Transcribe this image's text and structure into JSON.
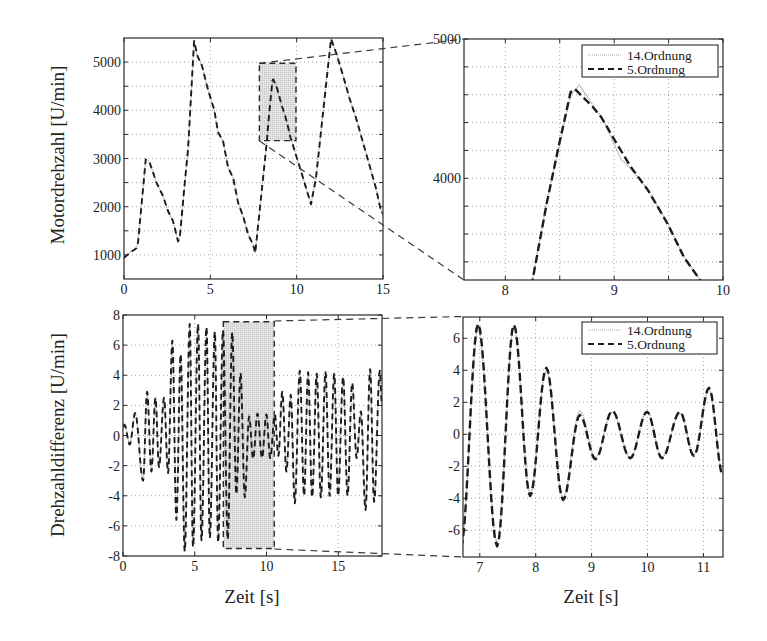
{
  "colors": {
    "series_14_ordnung": "#a6a6a6",
    "series_5_ordnung": "#1c1c1c",
    "zoom_fill": "#dadada",
    "grid": "#8c8c8c",
    "frame": "#2a2a2a"
  },
  "chart_data": [
    {
      "id": "motordrehzahl",
      "type": "line",
      "title": "",
      "xlabel": "",
      "ylabel": "Motordrehzahl [U/min]",
      "xlim": [
        0,
        15
      ],
      "ylim": [
        500,
        5500
      ],
      "xticks": [
        0,
        5,
        10,
        15
      ],
      "yticks": [
        1000,
        2000,
        3000,
        4000,
        5000
      ],
      "xgrid": [
        5,
        10
      ],
      "ygrid": [
        1000,
        1500,
        2000,
        2500,
        3000,
        3500,
        4000,
        4500,
        5000
      ],
      "grid": true,
      "legend": null,
      "interpolation": "linear",
      "zoom_region": {
        "x": [
          7.84,
          9.96
        ],
        "y": [
          3370,
          4975
        ]
      },
      "series": [
        {
          "name": "14.Ordnung",
          "style": "dotted",
          "color_key": "series_14_ordnung",
          "x": [
            0,
            0.33,
            0.72,
            0.81,
            1.26,
            1.49,
            1.88,
            2.26,
            2.55,
            2.84,
            3.13,
            3.23,
            3.52,
            3.71,
            4.06,
            4.25,
            4.52,
            4.78,
            5.03,
            5.22,
            5.45,
            5.74,
            6.03,
            6.32,
            6.61,
            6.9,
            7.19,
            7.48,
            7.6,
            8.25,
            8.38,
            8.49,
            8.6,
            8.64,
            8.8,
            8.88,
            9.0,
            9.15,
            9.31,
            9.49,
            9.64,
            9.78,
            10.25,
            10.83,
            11.12,
            11.6,
            11.99,
            12.28,
            12.66,
            13.05,
            13.43,
            13.82,
            14.2,
            14.59,
            14.88,
            15
          ],
          "y": [
            950,
            1050,
            1150,
            1260,
            2990,
            2920,
            2490,
            2230,
            1900,
            1710,
            1270,
            1360,
            2480,
            3200,
            5420,
            5140,
            4930,
            4530,
            4240,
            4010,
            3550,
            3350,
            2820,
            2590,
            2090,
            1790,
            1430,
            1200,
            1050,
            3275,
            3830,
            4250,
            4600,
            4670,
            4530,
            4420,
            4250,
            4060,
            3920,
            3680,
            3440,
            3280,
            2730,
            2060,
            2590,
            4200,
            5500,
            5190,
            4760,
            4250,
            3860,
            3350,
            2890,
            2380,
            1920,
            1840
          ]
        },
        {
          "name": "5.Ordnung",
          "style": "dashed",
          "color_key": "series_5_ordnung",
          "x": [
            0,
            0.33,
            0.72,
            0.81,
            1.26,
            1.49,
            1.88,
            2.26,
            2.55,
            2.84,
            3.13,
            3.23,
            3.52,
            3.71,
            4.06,
            4.25,
            4.52,
            4.78,
            5.03,
            5.22,
            5.45,
            5.74,
            6.03,
            6.32,
            6.61,
            6.9,
            7.19,
            7.48,
            7.6,
            8.25,
            8.38,
            8.49,
            8.6,
            8.64,
            8.8,
            8.88,
            9.0,
            9.15,
            9.31,
            9.49,
            9.64,
            9.78,
            10.25,
            10.83,
            11.12,
            11.6,
            11.99,
            12.28,
            12.66,
            13.05,
            13.43,
            13.82,
            14.2,
            14.59,
            14.88,
            15
          ],
          "y": [
            940,
            1040,
            1140,
            1250,
            2980,
            2910,
            2500,
            2220,
            1910,
            1700,
            1280,
            1350,
            2500,
            3190,
            5440,
            5130,
            4920,
            4540,
            4230,
            4020,
            3540,
            3360,
            2810,
            2600,
            2080,
            1800,
            1420,
            1210,
            1040,
            3270,
            3820,
            4230,
            4620,
            4640,
            4515,
            4440,
            4280,
            4085,
            3915,
            3675,
            3435,
            3280,
            2740,
            2050,
            2600,
            4190,
            5480,
            5200,
            4750,
            4260,
            3850,
            3360,
            2880,
            2390,
            1910,
            1850
          ]
        }
      ]
    },
    {
      "id": "motordrehzahl-zoom",
      "type": "line",
      "title": "",
      "xlabel": "",
      "ylabel": "",
      "xlim": [
        7.62,
        10
      ],
      "ylim": [
        3270,
        5000
      ],
      "xticks": [
        8,
        9,
        10
      ],
      "yticks": [
        4000,
        5000
      ],
      "xgrid": [
        8,
        8.5,
        9,
        9.5
      ],
      "ygrid": [
        3400,
        3600,
        3800,
        4000,
        4200,
        4400,
        4600,
        4800
      ],
      "grid": true,
      "legend": {
        "position": "upper right",
        "entries": [
          "14.Ordnung",
          "5.Ordnung"
        ]
      },
      "interpolation": "linear",
      "zoom_region": null,
      "series": [
        {
          "name": "14.Ordnung",
          "style": "dotted",
          "color_key": "series_14_ordnung",
          "x": [
            7.6,
            8.25,
            8.38,
            8.5,
            8.6,
            8.68,
            8.8,
            8.9,
            9.06,
            9.15,
            9.31,
            9.49,
            9.64,
            9.78,
            10.25
          ],
          "y": [
            1040,
            3275,
            3830,
            4250,
            4600,
            4670,
            4530,
            4420,
            4140,
            4070,
            3920,
            3680,
            3440,
            3280,
            2740
          ]
        },
        {
          "name": "5.Ordnung",
          "style": "dashed",
          "color_key": "series_5_ordnung",
          "x": [
            7.6,
            8.25,
            8.38,
            8.49,
            8.6,
            8.64,
            8.8,
            8.88,
            9.0,
            9.15,
            9.31,
            9.49,
            9.64,
            9.78,
            10.25
          ],
          "y": [
            1040,
            3270,
            3820,
            4230,
            4620,
            4640,
            4515,
            4440,
            4280,
            4085,
            3915,
            3675,
            3435,
            3280,
            2740
          ]
        }
      ]
    },
    {
      "id": "drehzahldifferenz",
      "type": "line",
      "title": "",
      "xlabel": "Zeit [s]",
      "ylabel": "Drehzahldifferenz [U/min]",
      "xlim": [
        0,
        18.05
      ],
      "ylim": [
        -8,
        8
      ],
      "xticks": [
        0,
        5,
        10,
        15
      ],
      "yticks": [
        -8,
        -6,
        -4,
        -2,
        0,
        2,
        4,
        6,
        8
      ],
      "xgrid": [
        5,
        10,
        15
      ],
      "ygrid": [
        -6,
        -4,
        -2,
        0,
        2,
        4,
        6
      ],
      "grid": true,
      "legend": null,
      "interpolation": "sinusoidal",
      "zoom_region": {
        "x": [
          6.99,
          10.54
        ],
        "y": [
          -7.5,
          7.55
        ]
      },
      "series": [
        {
          "name": "14.Ordnung",
          "style": "dotted",
          "color_key": "series_14_ordnung",
          "x": [
            0,
            0.1,
            0.47,
            0.85,
            1.4,
            1.68,
            1.98,
            2.26,
            2.51,
            2.86,
            3.14,
            3.44,
            3.72,
            4.02,
            4.3,
            4.65,
            4.88,
            5.23,
            5.47,
            5.82,
            6.05,
            6.4,
            6.63,
            6.97,
            7.3,
            7.61,
            7.9,
            8.19,
            8.49,
            8.79,
            9.07,
            9.37,
            9.69,
            9.99,
            10.26,
            10.58,
            10.83,
            11.1,
            11.39,
            11.69,
            11.97,
            12.32,
            12.62,
            12.9,
            13.18,
            13.5,
            13.79,
            14.11,
            14.4,
            14.72,
            14.99,
            15.34,
            15.65,
            15.97,
            16.28,
            16.58,
            16.9,
            17.22,
            17.5,
            17.9,
            18.05
          ],
          "y": [
            0.5,
            0.8,
            -0.5,
            1.4,
            -2.9,
            2.8,
            -2.3,
            2.6,
            -2.0,
            2.4,
            -2.4,
            6.1,
            -5.4,
            5.3,
            -7.5,
            7.2,
            -7.2,
            7.3,
            -6.8,
            7.0,
            -6.6,
            6.8,
            -6.9,
            6.8,
            -6.8,
            6.7,
            -3.7,
            4.0,
            -4.0,
            1.45,
            -1.45,
            1.4,
            -1.45,
            1.45,
            -1.45,
            1.35,
            -1.3,
            2.8,
            -2.3,
            2.6,
            -4.3,
            4.2,
            -3.9,
            4.1,
            -4.0,
            4.0,
            -4.0,
            4.1,
            -3.9,
            4.0,
            -3.9,
            3.8,
            -3.9,
            3.4,
            -1.4,
            1.5,
            -4.8,
            4.3,
            -4.3,
            4.2,
            1.9
          ]
        },
        {
          "name": "5.Ordnung",
          "style": "dashed",
          "color_key": "series_5_ordnung",
          "x": [
            0,
            0.1,
            0.47,
            0.85,
            1.4,
            1.68,
            1.98,
            2.26,
            2.51,
            2.86,
            3.14,
            3.44,
            3.72,
            4.02,
            4.3,
            4.65,
            4.88,
            5.23,
            5.47,
            5.82,
            6.05,
            6.4,
            6.63,
            6.97,
            7.3,
            7.61,
            7.9,
            8.19,
            8.49,
            8.79,
            9.07,
            9.37,
            9.69,
            9.99,
            10.26,
            10.58,
            10.83,
            11.1,
            11.39,
            11.69,
            11.97,
            12.32,
            12.62,
            12.9,
            13.18,
            13.5,
            13.79,
            14.11,
            14.4,
            14.72,
            14.99,
            15.34,
            15.65,
            15.97,
            16.28,
            16.58,
            16.9,
            17.22,
            17.5,
            17.9,
            18.05
          ],
          "y": [
            0.6,
            0.7,
            -0.6,
            1.5,
            -3.0,
            2.9,
            -2.4,
            2.5,
            -2.1,
            2.5,
            -2.5,
            6.3,
            -5.6,
            5.4,
            -7.7,
            7.4,
            -7.4,
            7.4,
            -6.95,
            7.2,
            -6.8,
            6.9,
            -7.1,
            7.0,
            -6.9,
            6.85,
            -3.9,
            4.15,
            -4.1,
            1.25,
            -1.55,
            1.45,
            -1.5,
            1.4,
            -1.5,
            1.4,
            -1.35,
            2.9,
            -2.4,
            2.7,
            -4.5,
            4.3,
            -4.0,
            4.2,
            -4.1,
            4.1,
            -4.1,
            4.2,
            -4.0,
            4.1,
            -4.0,
            3.9,
            -4.0,
            3.5,
            -1.5,
            1.6,
            -4.95,
            4.4,
            -4.4,
            4.3,
            2.0
          ]
        }
      ]
    },
    {
      "id": "drehzahldifferenz-zoom",
      "type": "line",
      "title": "",
      "xlabel": "Zeit [s]",
      "ylabel": "",
      "xlim": [
        6.7,
        11.35
      ],
      "ylim": [
        -7.67,
        7.33
      ],
      "xticks": [
        7,
        8,
        9,
        10,
        11
      ],
      "yticks": [
        -6,
        -4,
        -2,
        0,
        2,
        4,
        6
      ],
      "xgrid": [
        7,
        8,
        9,
        10,
        11
      ],
      "ygrid": [
        -6,
        -4,
        -2,
        0,
        2,
        4,
        6
      ],
      "grid": true,
      "legend": {
        "position": "upper right",
        "entries": [
          "14.Ordnung",
          "5.Ordnung"
        ]
      },
      "interpolation": "sinusoidal",
      "zoom_region": null,
      "series": [
        {
          "name": "14.Ordnung",
          "style": "dotted",
          "color_key": "series_14_ordnung",
          "x": [
            6.66,
            6.97,
            7.31,
            7.61,
            7.9,
            8.19,
            8.49,
            8.79,
            9.07,
            9.37,
            9.69,
            9.99,
            10.26,
            10.58,
            10.83,
            11.1,
            11.35
          ],
          "y": [
            -7.0,
            6.6,
            -6.8,
            6.7,
            -3.7,
            4.0,
            -4.0,
            1.45,
            -1.45,
            1.4,
            -1.45,
            1.45,
            -1.45,
            1.35,
            -1.3,
            2.8,
            -2.5
          ]
        },
        {
          "name": "5.Ordnung",
          "style": "dashed",
          "color_key": "series_5_ordnung",
          "x": [
            6.66,
            6.97,
            7.31,
            7.61,
            7.9,
            8.19,
            8.49,
            8.79,
            9.07,
            9.37,
            9.69,
            9.99,
            10.26,
            10.58,
            10.83,
            11.1,
            11.35
          ],
          "y": [
            -7.1,
            6.9,
            -7.0,
            6.85,
            -3.86,
            4.16,
            -4.1,
            1.2,
            -1.56,
            1.46,
            -1.5,
            1.4,
            -1.5,
            1.4,
            -1.35,
            2.9,
            -2.6
          ]
        }
      ]
    }
  ]
}
